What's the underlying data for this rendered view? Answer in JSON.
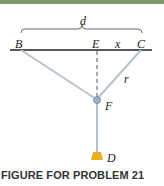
{
  "figure": {
    "caption": "FIGURE FOR PROBLEM 21",
    "labels": {
      "d": "d",
      "B": "B",
      "E": "E",
      "x": "x",
      "C": "C",
      "r": "r",
      "F": "F",
      "D": "D"
    },
    "colors": {
      "top_bar": "#7a9a6a",
      "ceiling_line": "#222222",
      "cables": "#b8c2c8",
      "dashed_line": "#444444",
      "pulley": "#9bb3c9",
      "weight": "#e8b020"
    }
  }
}
